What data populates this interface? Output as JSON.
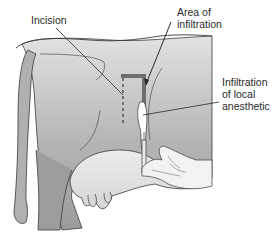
{
  "figure": {
    "labels": {
      "incision": "Incision",
      "area_of_infiltration_line1": "Area of",
      "area_of_infiltration_line2": "infiltration",
      "infiltration_line1": "Infiltration",
      "infiltration_line2": "of local",
      "infiltration_line3": "anesthetic"
    },
    "colors": {
      "body_light": "#d9d9d9",
      "body_dark": "#9a9a9a",
      "udder": "#e6e6e6",
      "outline": "#3a3a3a",
      "infiltration_band": "#6e6e6e",
      "hand": "#f2f2f2"
    }
  }
}
